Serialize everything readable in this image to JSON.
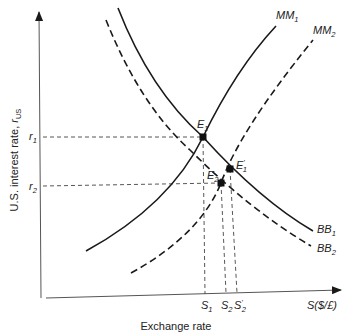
{
  "diagram": {
    "type": "economics-curve-diagram",
    "axes": {
      "y_label": "U.S. interest rate, ",
      "y_label_symbol": "r",
      "y_label_sub": "US",
      "x_label": "Exchange rate",
      "x_axis_end_label": "S($/£)",
      "y_ticks": [
        {
          "base": "r",
          "sub": "1"
        },
        {
          "base": "r",
          "sub": "2"
        }
      ],
      "x_ticks": [
        {
          "base": "S",
          "sub": "1",
          "prime": ""
        },
        {
          "base": "S",
          "sub": "2",
          "prime": ""
        },
        {
          "base": "S",
          "sub": "2",
          "prime": "'"
        }
      ]
    },
    "curves": [
      {
        "id": "MM1",
        "base": "MM",
        "sub": "1",
        "style": "solid",
        "slope": "upward"
      },
      {
        "id": "MM2",
        "base": "MM",
        "sub": "2",
        "style": "dashed",
        "slope": "upward"
      },
      {
        "id": "BB1",
        "base": "BB",
        "sub": "1",
        "style": "solid",
        "slope": "downward"
      },
      {
        "id": "BB2",
        "base": "BB",
        "sub": "2",
        "style": "dashed",
        "slope": "downward"
      }
    ],
    "equilibria": [
      {
        "id": "E1",
        "base": "E",
        "sub": "1",
        "prime": "",
        "on": [
          "MM1",
          "BB1"
        ],
        "rate": "r1",
        "exchange": "S1"
      },
      {
        "id": "E1prime",
        "base": "E",
        "sub": "1",
        "prime": "'",
        "on": [
          "MM2",
          "BB1"
        ],
        "exchange": "S'2"
      },
      {
        "id": "E2",
        "base": "E",
        "sub": "2",
        "prime": "",
        "on": [
          "MM2",
          "BB2"
        ],
        "rate": "r2",
        "exchange": "S2"
      }
    ]
  }
}
